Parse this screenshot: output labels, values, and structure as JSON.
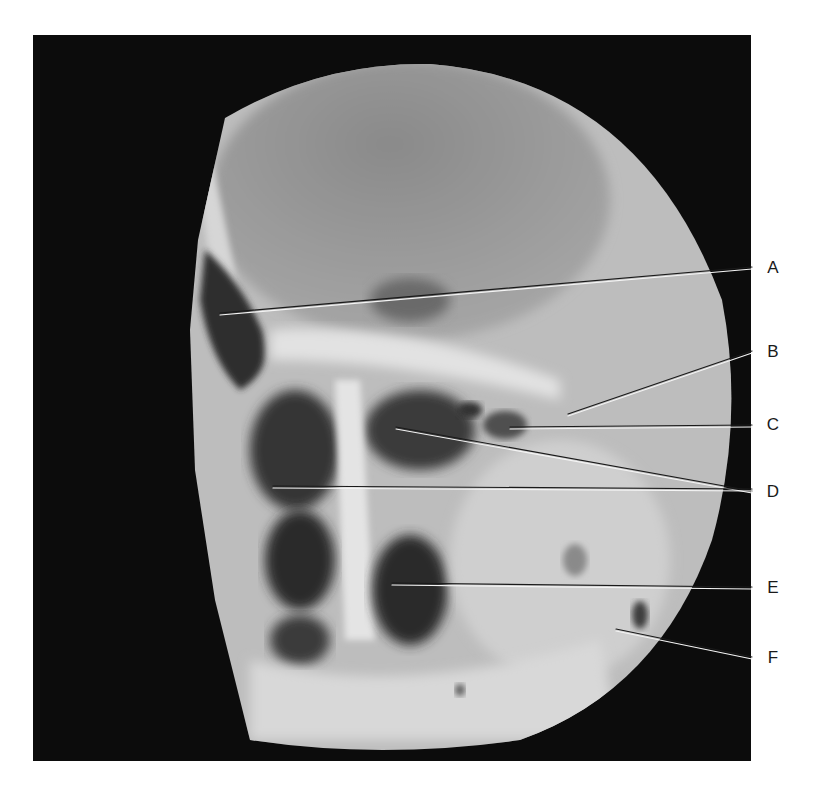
{
  "figure": {
    "type": "lateral skull radiograph (circular field)",
    "background_color": "#0c0c0c",
    "field_color": "#b4b4b4"
  },
  "labels": [
    {
      "letter": "A",
      "label_y": 258,
      "line": {
        "x1": 220,
        "y1": 314,
        "x2": 752,
        "y2": 268
      }
    },
    {
      "letter": "B",
      "label_y": 342,
      "line": {
        "x1": 568,
        "y1": 415,
        "x2": 752,
        "y2": 352
      }
    },
    {
      "letter": "C",
      "label_y": 415,
      "line": {
        "x1": 510,
        "y1": 428,
        "x2": 752,
        "y2": 426
      }
    },
    {
      "letter": "D",
      "label_y": 482,
      "lines": [
        {
          "x1": 396,
          "y1": 428,
          "x2": 752,
          "y2": 492
        },
        {
          "x1": 273,
          "y1": 487,
          "x2": 752,
          "y2": 490
        }
      ]
    },
    {
      "letter": "E",
      "label_y": 578,
      "line": {
        "x1": 392,
        "y1": 584,
        "x2": 752,
        "y2": 588
      }
    },
    {
      "letter": "F",
      "label_y": 648,
      "line": {
        "x1": 616,
        "y1": 630,
        "x2": 752,
        "y2": 658
      }
    }
  ]
}
